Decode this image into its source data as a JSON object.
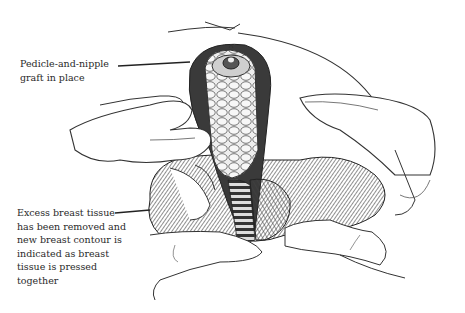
{
  "figure": {
    "labels": [
      {
        "id": "pedicle",
        "text": "Pedicle-and-nipple\ngraft in place"
      },
      {
        "id": "excess",
        "text": "Excess breast tissue\nhas been removed and\nnew breast contour is\nindicated as breast\ntissue is pressed\ntogether"
      }
    ],
    "colors": {
      "ink": "#2a2a2a",
      "background": "#ffffff",
      "shade": "#555555"
    }
  }
}
